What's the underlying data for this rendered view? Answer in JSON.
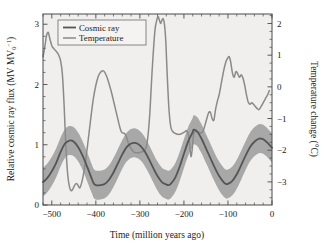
{
  "figure": {
    "background_color": "#ffffff",
    "plot_background_color": "#f0efee",
    "frame_color": "#4a4a4a"
  },
  "legend": {
    "position": "top-left-inside",
    "entries": [
      {
        "label": "Cosmic ray",
        "color": "#555555"
      },
      {
        "label": "Temperature",
        "color": "#8a8a8a"
      }
    ]
  },
  "axes": {
    "x": {
      "label": "Time (million years ago)",
      "ticks": [
        "-500",
        "-400",
        "-300",
        "-200",
        "-100",
        "0"
      ],
      "tick_values": [
        -500,
        -400,
        -300,
        -200,
        -100,
        0
      ],
      "minor_tick_step": 20,
      "range": [
        -520,
        0
      ]
    },
    "y_left": {
      "label_main": "Relative cosmic ray flux (MV MV",
      "label_sub": "0",
      "label_sup": "-1",
      "label_tail": ")",
      "label_plain": "Relative cosmic ray flux (MV MV0^-1)",
      "ticks": [
        "0",
        "1",
        "2",
        "3"
      ],
      "tick_values": [
        0,
        1,
        2,
        3
      ],
      "range": [
        0,
        3.17
      ],
      "minor_tick_step": 0.2
    },
    "y_right": {
      "label_main": "Temperature change (",
      "label_degree": "°C)",
      "label_plain": "Temperature change (°C)",
      "ticks": [
        "-3",
        "-2",
        "-1",
        "0",
        "1",
        "2"
      ],
      "tick_values": [
        -3,
        -2,
        -1,
        0,
        1,
        2
      ],
      "range": [
        -3.73,
        2.3
      ],
      "minor_tick_step": 0.25
    }
  },
  "chart_data": {
    "type": "line",
    "title": "",
    "xlabel": "Time (million years ago)",
    "ylabel": "Relative cosmic ray flux (MV MV0^-1)",
    "ylabel_right": "Temperature change (°C)",
    "xlim": [
      -520,
      0
    ],
    "ylim": [
      0,
      3.17
    ],
    "ylim_right": [
      -3.73,
      2.3
    ],
    "grid": false,
    "legend_position": "upper left",
    "series": [
      {
        "name": "Cosmic ray",
        "axis": "left",
        "color": "#555555",
        "line_width": 1.8,
        "band": {
          "name": "Cosmic ray uncertainty band",
          "color": "#a8a8a8",
          "half_width": 0.24
        },
        "x": [
          -520,
          -510,
          -500,
          -490,
          -480,
          -470,
          -460,
          -450,
          -440,
          -430,
          -420,
          -410,
          -405,
          -400,
          -390,
          -380,
          -370,
          -360,
          -350,
          -340,
          -330,
          -320,
          -310,
          -300,
          -290,
          -280,
          -270,
          -260,
          -250,
          -240,
          -235,
          -230,
          -220,
          -210,
          -200,
          -190,
          -180,
          -178,
          -170,
          -160,
          -150,
          -140,
          -130,
          -120,
          -110,
          -105,
          -100,
          -90,
          -80,
          -70,
          -60,
          -50,
          -40,
          -30,
          -25,
          -20,
          -10,
          0
        ],
        "y": [
          0.38,
          0.45,
          0.56,
          0.7,
          0.88,
          1.02,
          1.07,
          1.05,
          0.96,
          0.82,
          0.64,
          0.45,
          0.36,
          0.33,
          0.33,
          0.35,
          0.42,
          0.54,
          0.69,
          0.84,
          0.96,
          1.02,
          1.03,
          0.99,
          0.9,
          0.77,
          0.62,
          0.48,
          0.38,
          0.34,
          0.33,
          0.35,
          0.45,
          0.63,
          0.85,
          1.06,
          1.21,
          1.25,
          1.22,
          1.1,
          0.94,
          0.78,
          0.62,
          0.48,
          0.38,
          0.35,
          0.35,
          0.4,
          0.51,
          0.66,
          0.82,
          0.96,
          1.05,
          1.1,
          1.1,
          1.09,
          1.03,
          0.95
        ]
      },
      {
        "name": "Temperature",
        "axis": "right",
        "color": "#8a8a8a",
        "line_width": 1.5,
        "x": [
          -520,
          -516,
          -512,
          -508,
          -505,
          -500,
          -495,
          -490,
          -485,
          -480,
          -476,
          -472,
          -468,
          -464,
          -460,
          -456,
          -452,
          -448,
          -444,
          -440,
          -436,
          -430,
          -424,
          -418,
          -412,
          -406,
          -400,
          -394,
          -388,
          -382,
          -376,
          -370,
          -364,
          -358,
          -352,
          -346,
          -342,
          -338,
          -334,
          -330,
          -326,
          -320,
          -314,
          -308,
          -302,
          -296,
          -290,
          -284,
          -278,
          -272,
          -266,
          -262,
          -259,
          -256,
          -253,
          -250,
          -247,
          -244,
          -241,
          -238,
          -234,
          -230,
          -226,
          -222,
          -218,
          -214,
          -210,
          -206,
          -202,
          -198,
          -194,
          -190,
          -187,
          -184,
          -181,
          -178,
          -175,
          -172,
          -168,
          -164,
          -160,
          -156,
          -152,
          -148,
          -144,
          -140,
          -136,
          -132,
          -128,
          -124,
          -120,
          -116,
          -112,
          -108,
          -104,
          -100,
          -97,
          -94,
          -90,
          -86,
          -82,
          -78,
          -74,
          -70,
          -66,
          -62,
          -58,
          -54,
          -50,
          -46,
          -42,
          -38,
          -34,
          -30,
          -26,
          -22,
          -18,
          -14,
          -10,
          -6,
          -2,
          0
        ],
        "y_right_values": [
          0.95,
          1.25,
          1.62,
          1.72,
          1.55,
          1.3,
          1.2,
          1.12,
          1.02,
          0.82,
          0.4,
          -0.6,
          -1.9,
          -2.75,
          -3.15,
          -3.28,
          -3.22,
          -3.1,
          -3.05,
          -3.12,
          -3.18,
          -2.9,
          -2.4,
          -1.75,
          -1.05,
          -0.4,
          0.05,
          0.35,
          0.48,
          0.5,
          0.35,
          0.1,
          -0.2,
          -0.55,
          -0.9,
          -1.25,
          -1.42,
          -1.46,
          -1.48,
          -1.6,
          -1.78,
          -1.95,
          -2.05,
          -2.08,
          -2.08,
          -2.05,
          -2.02,
          -1.8,
          -0.95,
          0.55,
          1.75,
          2.08,
          2.22,
          2.12,
          2.0,
          2.1,
          2.15,
          1.95,
          1.4,
          0.4,
          -0.7,
          -1.25,
          -1.4,
          -1.45,
          -1.48,
          -1.5,
          -1.5,
          -1.48,
          -1.45,
          -1.42,
          -1.38,
          -1.5,
          -1.8,
          -2.2,
          -1.95,
          -1.5,
          -1.42,
          -1.4,
          -1.42,
          -1.45,
          -1.45,
          -1.38,
          -1.2,
          -1.0,
          -0.82,
          -0.8,
          -1.0,
          -1.05,
          -0.7,
          -0.45,
          -0.25,
          0.05,
          0.35,
          0.62,
          0.82,
          0.92,
          0.95,
          0.8,
          0.45,
          0.3,
          0.48,
          0.42,
          0.3,
          0.38,
          0.28,
          0.05,
          -0.25,
          -0.48,
          -0.55,
          -0.5,
          -0.55,
          -0.62,
          -0.68,
          -0.72,
          -0.65,
          -0.55,
          -0.45,
          -0.35,
          -0.25,
          -0.12,
          -0.02
        ]
      }
    ]
  }
}
